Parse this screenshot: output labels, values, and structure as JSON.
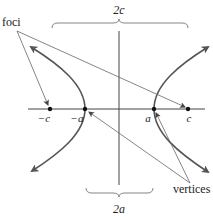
{
  "diagram": {
    "labels": {
      "foci": "foci",
      "vertices": "vertices",
      "two_c": "2c",
      "two_a": "2a",
      "neg_c": "−c",
      "neg_a": "−a",
      "pos_a": "a",
      "pos_c": "c"
    },
    "points": {
      "neg_c_x": 50,
      "neg_a_x": 85,
      "pos_a_x": 154,
      "pos_c_x": 188,
      "axis_y": 109
    },
    "colors": {
      "curve": "#555555",
      "axis": "#444444",
      "pointer": "#666666",
      "text": "#222222"
    }
  }
}
